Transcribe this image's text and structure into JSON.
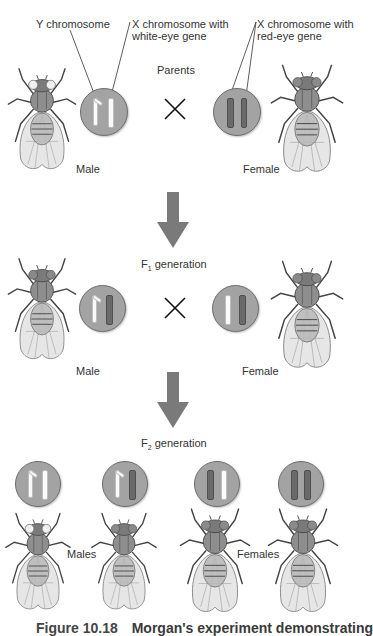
{
  "figure": {
    "caption_label": "Figure 10.18",
    "caption_text": "Morgan's experiment demonstrating",
    "labels": {
      "y_chromosome": "Y chromosome",
      "x_white_line1": "X chromosome with",
      "x_white_line2": "white-eye gene",
      "x_red_line1": "X chromosome with",
      "x_red_line2": "red-eye gene"
    }
  },
  "parents": {
    "title": "Parents",
    "male_label": "Male",
    "female_label": "Female",
    "male_chromosomes": [
      "Y",
      "X (white-eye)"
    ],
    "female_chromosomes": [
      "X (red-eye)",
      "X (red-eye)"
    ]
  },
  "f1": {
    "title_prefix": "F",
    "title_sub": "1",
    "title_suffix": " generation",
    "male_label": "Male",
    "female_label": "Female",
    "male_chromosomes": [
      "Y",
      "X (red-eye)"
    ],
    "female_chromosomes": [
      "X (white-eye)",
      "X (red-eye)"
    ]
  },
  "f2": {
    "title_prefix": "F",
    "title_sub": "2",
    "title_suffix": " generation",
    "males_label": "Males",
    "females_label": "Females",
    "individuals": [
      {
        "sex": "male",
        "chromosomes": [
          "Y",
          "X (white-eye)"
        ]
      },
      {
        "sex": "male",
        "chromosomes": [
          "Y",
          "X (red-eye)"
        ]
      },
      {
        "sex": "female",
        "chromosomes": [
          "X (red-eye)",
          "X (white-eye)"
        ]
      },
      {
        "sex": "female",
        "chromosomes": [
          "X (red-eye)",
          "X (red-eye)"
        ]
      }
    ]
  },
  "colors": {
    "circle_fill": "#a3a3a3",
    "white_chromosome": "#fbfbfb",
    "red_chromosome": "#6a6a6a",
    "arrow": "#7a7a7a"
  }
}
